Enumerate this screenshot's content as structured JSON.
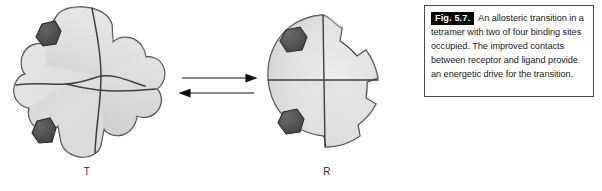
{
  "figure": {
    "caption_tag": "Fig. 5.7.",
    "caption_body": "An allosteric transition in a tetramer with two of four binding sites occupied. The improved contacts between receptor and ligand provide an energetic drive for the transition.",
    "colors": {
      "protein_fill_light": "#ebebeb",
      "protein_fill_mid": "#d9d9d9",
      "protein_fill_dark": "#c2c2c2",
      "protein_outline": "#3a3a3a",
      "subunit_divider": "#4a4a4a",
      "ligand_fill": "#4f4f4f",
      "ligand_outline": "#2b2b2b",
      "arrow": "#111111",
      "caption_border": "#4a4a4a",
      "caption_tag_bg": "#000000",
      "caption_tag_fg": "#ffffff",
      "text": "#1a1a1a"
    }
  },
  "left_panel": {
    "state_label": "T",
    "description": "tense-state tetramer, cross-shaped subunits, irregular interfaces",
    "subunit_count": 4,
    "ligand_count": 2,
    "ligand_positions": [
      "upper-left",
      "lower-left"
    ]
  },
  "right_panel": {
    "state_label": "R",
    "description": "relaxed-state tetramer, rounded circular subunits, straight interfaces",
    "subunit_count": 4,
    "ligand_count": 2,
    "ligand_positions": [
      "upper-left",
      "lower-left"
    ]
  },
  "equilibrium": {
    "forward_arrow": "right",
    "reverse_arrow": "left"
  }
}
